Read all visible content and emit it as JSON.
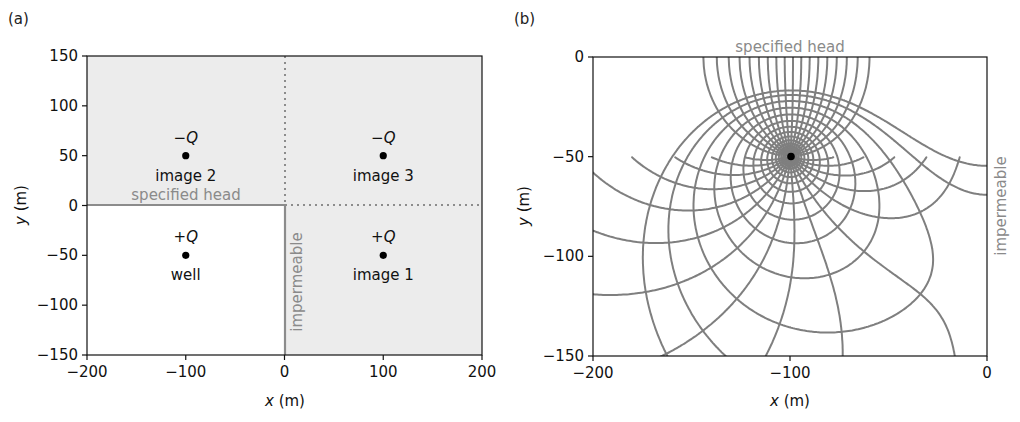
{
  "chart_data": [
    {
      "panel": "(a)",
      "type": "scatter",
      "title": "",
      "xlabel": "x (m)",
      "ylabel": "y (m)",
      "xlim": [
        -200,
        200
      ],
      "ylim": [
        -150,
        150
      ],
      "xticks": [
        -200,
        -100,
        0,
        100,
        200
      ],
      "xtick_labels": [
        "−200",
        "−100",
        "0",
        "100",
        "200"
      ],
      "yticks": [
        150,
        100,
        50,
        0,
        -50,
        -100,
        -150
      ],
      "ytick_labels": [
        "150",
        "100",
        "50",
        "0",
        "−50",
        "−100",
        "−150"
      ],
      "grid": false,
      "points": [
        {
          "name": "well",
          "x": -100,
          "y": -50,
          "sign_label": "+Q"
        },
        {
          "name": "image 1",
          "x": 100,
          "y": -50,
          "sign_label": "+Q"
        },
        {
          "name": "image 2",
          "x": -100,
          "y": 50,
          "sign_label": "−Q"
        },
        {
          "name": "image 3",
          "x": 100,
          "y": 50,
          "sign_label": "−Q"
        }
      ],
      "boundaries": [
        {
          "label": "specified head",
          "type": "solid",
          "from": [
            -200,
            0
          ],
          "to": [
            0,
            0
          ]
        },
        {
          "label": "impermeable",
          "type": "solid",
          "from": [
            0,
            0
          ],
          "to": [
            0,
            -150
          ]
        },
        {
          "label": "",
          "type": "dotted",
          "from": [
            0,
            0
          ],
          "to": [
            200,
            0
          ]
        },
        {
          "label": "",
          "type": "dotted",
          "from": [
            0,
            0
          ],
          "to": [
            0,
            150
          ]
        }
      ],
      "shaded_region": "outside real domain (x<-200..200, y>0 or x>0)"
    },
    {
      "panel": "(b)",
      "type": "line",
      "title": "",
      "description": "flow net: equipotentials and streamlines around well",
      "xlabel": "x (m)",
      "ylabel": "y (m)",
      "xlim": [
        -200,
        0
      ],
      "ylim": [
        -150,
        0
      ],
      "xticks": [
        -200,
        -100,
        0
      ],
      "xtick_labels": [
        "−200",
        "−100",
        "0"
      ],
      "yticks": [
        0,
        -50,
        -100,
        -150
      ],
      "ytick_labels": [
        "0",
        "−50",
        "−100",
        "−150"
      ],
      "grid": false,
      "well": {
        "x": -100,
        "y": -50
      },
      "sources": [
        {
          "x": -100,
          "y": -50,
          "strength": 1
        },
        {
          "x": 100,
          "y": -50,
          "strength": 1
        },
        {
          "x": -100,
          "y": 50,
          "strength": -1
        },
        {
          "x": 100,
          "y": 50,
          "strength": -1
        }
      ],
      "n_equipotentials": 16,
      "n_streamlines": 36,
      "boundary_labels": {
        "top": "specified head",
        "right": "impermeable"
      },
      "line_color": "#7f7f7f"
    }
  ],
  "labels": {
    "panel_a": "(a)",
    "panel_b": "(b)",
    "x_axis": "x",
    "y_axis": "y",
    "unit": " (m)",
    "specified_head": "specified head",
    "impermeable": "impermeable"
  },
  "colors": {
    "shade": "#ececec",
    "boundary": "#8c8c8c",
    "flow_lines": "#7f7f7f",
    "axis": "#111111"
  }
}
